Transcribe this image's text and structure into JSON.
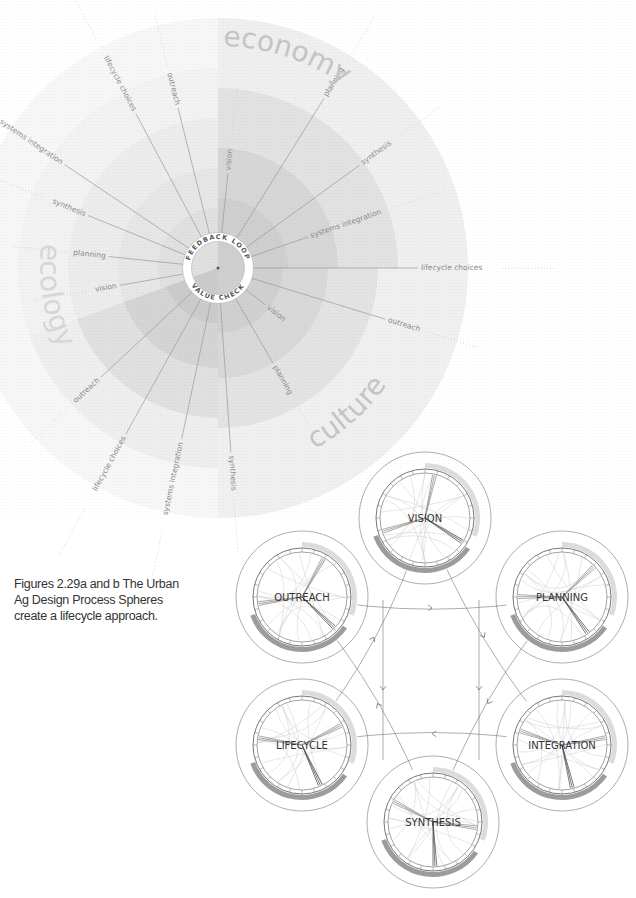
{
  "figure_a": {
    "center": [
      218,
      268
    ],
    "domains": [
      {
        "label": "economy",
        "angle_start": -90,
        "angle_end": 0,
        "color": "#c8c8c8"
      },
      {
        "label": "culture",
        "angle_start": 0,
        "angle_end": 90,
        "color": "#c8c8c8"
      },
      {
        "label": "ecology",
        "angle_start": 90,
        "angle_end": 180,
        "color": "#c8c8c8"
      }
    ],
    "inner_ring": {
      "top_label": "FEEDBACK LOOP",
      "bottom_label": "VALUE CHECK"
    },
    "spokes": [
      {
        "label": "outreach",
        "angle": -104
      },
      {
        "label": "lifecycle choices",
        "angle": -118
      },
      {
        "label": "systems integration",
        "angle": -146
      },
      {
        "label": "synthesis",
        "angle": -158
      },
      {
        "label": "planning",
        "angle": -174
      },
      {
        "label": "vision",
        "angle": 170
      },
      {
        "label": "vision",
        "angle": -84
      },
      {
        "label": "planning",
        "angle": -58
      },
      {
        "label": "synthesis",
        "angle": -36
      },
      {
        "label": "systems integration",
        "angle": -19
      },
      {
        "label": "lifecycle choices",
        "angle": 0
      },
      {
        "label": "outreach",
        "angle": 17
      },
      {
        "label": "vision",
        "angle": 38
      },
      {
        "label": "planning",
        "angle": 60
      },
      {
        "label": "synthesis",
        "angle": 86
      },
      {
        "label": "systems integration",
        "angle": 102
      },
      {
        "label": "lifecycle choices",
        "angle": 119
      },
      {
        "label": "outreach",
        "angle": 137
      }
    ]
  },
  "figure_b": {
    "spheres": [
      {
        "label": "VISION",
        "cx": 425,
        "cy": 518
      },
      {
        "label": "OUTREACH",
        "cx": 302,
        "cy": 597
      },
      {
        "label": "PLANNING",
        "cx": 562,
        "cy": 597
      },
      {
        "label": "LIFECYCLE",
        "cx": 302,
        "cy": 745
      },
      {
        "label": "INTEGRATION",
        "cx": 562,
        "cy": 745
      },
      {
        "label": "SYNTHESIS",
        "cx": 433,
        "cy": 822
      }
    ]
  },
  "caption": {
    "line1": "Figures 2.29a and b   The Urban",
    "line2": "Ag Design Process Spheres",
    "line3": "create a lifecycle approach."
  },
  "colors": {
    "band_light": "#efefef",
    "band_mid": "#e2e2e2",
    "band_dark": "#d2d2d2",
    "spoke": "#9a9a9a",
    "label": "#8a8a8a",
    "domain_label": "#c4c4c4",
    "ring_dark": "#9c9c9c",
    "ring_light": "#dcdcdc"
  }
}
